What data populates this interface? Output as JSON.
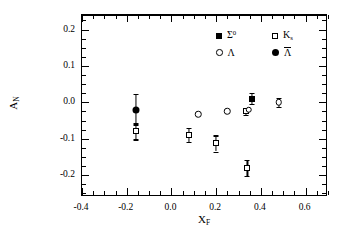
{
  "figure": {
    "background": "#ffffff",
    "foreground": "#000000"
  },
  "axes": {
    "x_title": "X",
    "x_title_sub": "F",
    "y_title": "A",
    "y_title_sub": "N",
    "x_ticks": [
      "-0.4",
      "-0.2",
      "0.0",
      "0.2",
      "0.4",
      "0.6"
    ],
    "x_tick_values": [
      -0.4,
      -0.2,
      0.0,
      0.2,
      0.4,
      0.6
    ],
    "y_ticks": [
      "0.2",
      "0.1",
      "0.0",
      "-0.1",
      "-0.2"
    ],
    "y_tick_values": [
      0.2,
      0.1,
      0.0,
      -0.1,
      -0.2
    ],
    "xlim": [
      -0.4,
      0.7
    ],
    "ylim": [
      -0.26,
      0.24
    ]
  },
  "legend": {
    "position": "upper-right",
    "entries": [
      {
        "marker": "filled-square",
        "label": "Σ",
        "sup": "0",
        "sub": "",
        "overbar": false,
        "series": "Sigma0"
      },
      {
        "marker": "open-square",
        "label": "K",
        "sup": "",
        "sub": "s",
        "overbar": false,
        "series": "Ks"
      },
      {
        "marker": "open-circle",
        "label": "Λ",
        "sup": "",
        "sub": "",
        "overbar": false,
        "series": "Lambda"
      },
      {
        "marker": "filled-circle",
        "label": "Λ",
        "sup": "",
        "sub": "",
        "overbar": true,
        "series": "AntiLambda"
      }
    ]
  },
  "chart_data": {
    "type": "scatter",
    "title": "",
    "xlabel": "X_F",
    "ylabel": "A_N",
    "xlim": [
      -0.4,
      0.7
    ],
    "ylim": [
      -0.26,
      0.24
    ],
    "grid": false,
    "zero_reference_line": 0.0,
    "legend_position": "upper right",
    "series": [
      {
        "name": "K_s",
        "marker": "open-square",
        "points": [
          {
            "x": -0.16,
            "y": -0.08,
            "yerr": 0.022
          },
          {
            "x": 0.08,
            "y": -0.09,
            "yerr": 0.02
          },
          {
            "x": 0.2,
            "y": -0.113,
            "yerr": 0.022
          },
          {
            "x": 0.34,
            "y": -0.18,
            "yerr": 0.022
          },
          {
            "x": 0.335,
            "y": -0.025,
            "yerr": 0.01
          }
        ]
      },
      {
        "name": "Lambda",
        "marker": "open-circle",
        "points": [
          {
            "x": 0.12,
            "y": -0.033,
            "yerr": 0.0
          },
          {
            "x": 0.25,
            "y": -0.025,
            "yerr": 0.0
          },
          {
            "x": 0.345,
            "y": -0.02,
            "yerr": 0.0
          },
          {
            "x": 0.48,
            "y": 0.0,
            "yerr": 0.012
          }
        ]
      },
      {
        "name": "AntiLambda",
        "marker": "filled-circle",
        "points": [
          {
            "x": -0.16,
            "y": -0.02,
            "yerr": 0.042
          }
        ]
      },
      {
        "name": "Sigma0",
        "marker": "filled-square",
        "points": [
          {
            "x": 0.36,
            "y": 0.01,
            "yerr": 0.015
          }
        ]
      }
    ]
  }
}
